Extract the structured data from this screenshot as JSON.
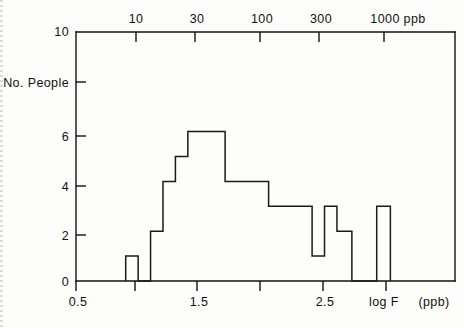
{
  "chart_data": {
    "type": "bar",
    "title": "",
    "subtitle": "",
    "xlabel": "log F",
    "xlabel_units": "(ppb)",
    "ylabel": "No. People",
    "top_axis_label": "ppb",
    "xlim": [
      0.5,
      3.55
    ],
    "ylim": [
      0,
      10
    ],
    "grid": false,
    "legend": "none",
    "x_tick_labels": [
      "0.5",
      "",
      "1.5",
      "",
      "2.5",
      ""
    ],
    "x_tick_values": [
      0.5,
      1.0,
      1.5,
      2.0,
      2.5,
      3.0
    ],
    "y_tick_labels": [
      "0",
      "2",
      "4",
      "6",
      "No. People",
      "10"
    ],
    "y_tick_values": [
      0,
      2,
      4,
      6,
      8,
      10
    ],
    "top_axis_tick_labels": [
      "10",
      "30",
      "100",
      "300",
      "1000 ppb"
    ],
    "top_axis_tick_values": [
      1.0,
      1.477,
      2.0,
      2.477,
      3.0
    ],
    "bin_edges": [
      0.9,
      1.0,
      1.1,
      1.2,
      1.3,
      1.4,
      1.5,
      1.6,
      1.8,
      2.0,
      2.4,
      2.5,
      2.6,
      2.7,
      2.8,
      3.0,
      3.1
    ],
    "values": [
      1,
      0,
      2,
      4,
      5,
      6,
      6,
      4,
      4,
      4,
      3,
      1,
      3,
      2,
      0,
      3
    ],
    "bars": [
      {
        "x0": 0.9,
        "x1": 1.0,
        "height": 1
      },
      {
        "x0": 1.0,
        "x1": 1.1,
        "height": 0
      },
      {
        "x0": 1.1,
        "x1": 1.2,
        "height": 2
      },
      {
        "x0": 1.2,
        "x1": 1.3,
        "height": 4
      },
      {
        "x0": 1.3,
        "x1": 1.4,
        "height": 5
      },
      {
        "x0": 1.4,
        "x1": 1.5,
        "height": 6
      },
      {
        "x0": 1.5,
        "x1": 1.7,
        "height": 6
      },
      {
        "x0": 1.7,
        "x1": 2.05,
        "height": 4
      },
      {
        "x0": 2.05,
        "x1": 2.4,
        "height": 3
      },
      {
        "x0": 2.4,
        "x1": 2.5,
        "height": 1
      },
      {
        "x0": 2.5,
        "x1": 2.6,
        "height": 3
      },
      {
        "x0": 2.6,
        "x1": 2.72,
        "height": 2
      },
      {
        "x0": 2.72,
        "x1": 2.92,
        "height": 0
      },
      {
        "x0": 2.92,
        "x1": 3.03,
        "height": 3
      }
    ]
  },
  "axes": {
    "y_title": "No. People",
    "y_top_label": "10",
    "y_labels": [
      "6",
      "4",
      "2",
      "0"
    ],
    "x_labels": [
      "0.5",
      "1.5",
      "2.5"
    ],
    "x_axis_name": "log F",
    "x_axis_units": "(ppb)",
    "top_labels": [
      "10",
      "30",
      "100",
      "300",
      "1000 ppb"
    ]
  }
}
